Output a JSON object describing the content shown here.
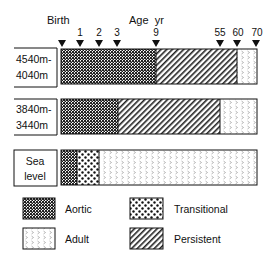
{
  "header": {
    "birth_label": "Birth",
    "age_label": "Age  yr"
  },
  "ticks": [
    {
      "label": "",
      "x": 62
    },
    {
      "label": "1",
      "x": 80
    },
    {
      "label": "2",
      "x": 99
    },
    {
      "label": "3",
      "x": 117
    },
    {
      "label": "9",
      "x": 156
    },
    {
      "label": "55",
      "x": 220
    },
    {
      "label": "60",
      "x": 237
    },
    {
      "label": "70",
      "x": 256
    }
  ],
  "rows": [
    {
      "label_line1": "4540m-",
      "label_line2": "4040m",
      "segments": [
        {
          "type": "Aortic",
          "from": "Birth",
          "to": "9"
        },
        {
          "type": "Persistent",
          "from": "9",
          "to": "60"
        },
        {
          "type": "Adult",
          "from": "60",
          "to": "70"
        }
      ]
    },
    {
      "label_line1": "3840m-",
      "label_line2": "3440m",
      "segments": [
        {
          "type": "Aortic",
          "from": "Birth",
          "to": "3"
        },
        {
          "type": "Persistent",
          "from": "3",
          "to": "55"
        },
        {
          "type": "Adult",
          "from": "55",
          "to": "70"
        }
      ]
    },
    {
      "label_line1": "Sea",
      "label_line2": "level",
      "segments": [
        {
          "type": "Aortic",
          "from": "Birth",
          "to": "~0.8"
        },
        {
          "type": "Transitional",
          "from": "~0.8",
          "to": "~2"
        },
        {
          "type": "Adult",
          "from": "~2",
          "to": "70"
        }
      ]
    }
  ],
  "legend": {
    "aortic": "Aortic",
    "transitional": "Transitional",
    "adult": "Adult",
    "persistent": "Persistent"
  }
}
